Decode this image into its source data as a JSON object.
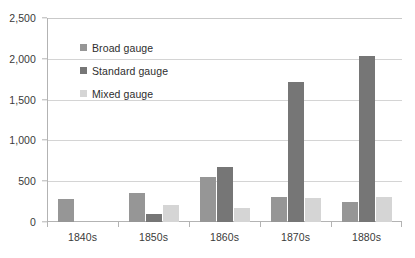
{
  "chart_data": {
    "type": "bar",
    "title": "",
    "subtitle": "",
    "xlabel": "",
    "ylabel": "",
    "categories": [
      "1840s",
      "1850s",
      "1860s",
      "1870s",
      "1880s"
    ],
    "series": [
      {
        "name": "Broad gauge",
        "color": "#969696",
        "values": [
          285,
          350,
          550,
          305,
          245
        ]
      },
      {
        "name": "Standard gauge",
        "color": "#767676",
        "values": [
          0,
          95,
          680,
          1710,
          2040
        ]
      },
      {
        "name": "Mixed gauge",
        "color": "#d5d5d5",
        "values": [
          0,
          205,
          175,
          290,
          305
        ]
      }
    ],
    "ylim": [
      0,
      2500
    ],
    "ytick_values": [
      0,
      500,
      1000,
      1500,
      2000,
      2500
    ],
    "ytick_labels": [
      "0",
      "500",
      "1,000",
      "1,500",
      "2,000",
      "2,500"
    ],
    "grid": true,
    "grid_axis": "y",
    "legend_position": "upper-left-inside",
    "legend_entries": [
      "Broad gauge",
      "Standard gauge",
      "Mixed gauge"
    ]
  },
  "axes": {
    "y": {
      "labels": [
        "2,500",
        "2,000",
        "1,500",
        "1,000",
        "500",
        "0"
      ]
    },
    "x": {
      "labels": [
        "1840s",
        "1850s",
        "1860s",
        "1870s",
        "1880s"
      ]
    }
  },
  "legend": {
    "items": [
      {
        "label": "Broad gauge",
        "swatch": "broad"
      },
      {
        "label": "Standard gauge",
        "swatch": "standard"
      },
      {
        "label": "Mixed gauge",
        "swatch": "mixed"
      }
    ]
  }
}
